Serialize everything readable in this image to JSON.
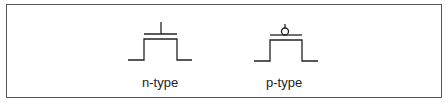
{
  "figure": {
    "symbols": [
      {
        "label": "n-type",
        "gate_bubble": false
      },
      {
        "label": "p-type",
        "gate_bubble": true
      }
    ]
  }
}
